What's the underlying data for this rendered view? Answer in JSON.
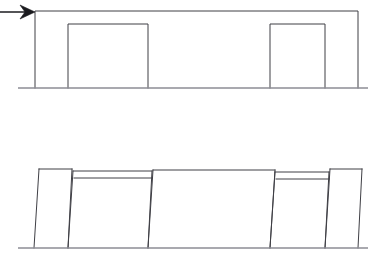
{
  "figure": {
    "background_color": "#ffffff",
    "line_color": "#3f3f45",
    "ground_color": "#8d8d94",
    "arrow_color": "#1b1b1f",
    "width": 380,
    "height": 258,
    "panels": [
      {
        "id": "undeformed-frame",
        "label": "undeformed frame elevation",
        "ground_line": {
          "x1": 18,
          "y1": 88,
          "x2": 368,
          "y2": 88
        },
        "outer_outline": "M 35,88 L 35,11 L 358,11 L 358,88",
        "openings": [
          {
            "id": "opening-left",
            "x": 68,
            "y": 24,
            "width": 80,
            "height": 64,
            "outline": "M 68,88 L 68,24 L 148,24 L 148,88"
          },
          {
            "id": "opening-right",
            "x": 270,
            "y": 24,
            "width": 55,
            "height": 64,
            "outline": "M 270,88 L 270,24 L 325,24 L 325,88"
          }
        ]
      },
      {
        "id": "deformed-frame",
        "label": "deformed frame elevation with lateral sway",
        "ground_line": {
          "x1": 18,
          "y1": 248,
          "x2": 368,
          "y2": 248
        },
        "members": [
          {
            "id": "pier-1-left",
            "outline": "M 34,248 L 39,169"
          },
          {
            "id": "pier-1-right",
            "outline": "M 68,248 L 72,169"
          },
          {
            "id": "pier-1-top",
            "outline": "M 39,169 L 72,169"
          },
          {
            "id": "pier-2-left",
            "outline": "M 68,248 L 73,171"
          },
          {
            "id": "pier-2-right",
            "outline": "M 148,248 L 152,171"
          },
          {
            "id": "pier-2-top",
            "outline": "M 73,171 L 152,171"
          },
          {
            "id": "pier-2-soffit",
            "outline": "M 74,178 L 152,178"
          },
          {
            "id": "bay-mid-left",
            "outline": "M 148,248 L 153,170"
          },
          {
            "id": "bay-mid-right",
            "outline": "M 270,248 L 275,170"
          },
          {
            "id": "bay-mid-top",
            "outline": "M 153,170 L 275,170"
          },
          {
            "id": "pier-3-left",
            "outline": "M 270,248 L 275,172"
          },
          {
            "id": "pier-3-right",
            "outline": "M 325,248 L 329,172"
          },
          {
            "id": "pier-3-top",
            "outline": "M 275,172 L 329,172"
          },
          {
            "id": "pier-3-soffit",
            "outline": "M 276,179 L 329,179"
          },
          {
            "id": "pier-4-left",
            "outline": "M 325,248 L 330,169"
          },
          {
            "id": "pier-4-right",
            "outline": "M 358,248 L 362,169"
          },
          {
            "id": "pier-4-top",
            "outline": "M 330,169 L 362,169"
          }
        ]
      }
    ],
    "annotations": [
      {
        "id": "lateral-load-arrow",
        "label": "lateral load arrow",
        "shaft": {
          "x1": 0,
          "y1": 12,
          "x2": 27,
          "y2": 12
        },
        "head_points": "20,5 35,12 20,19 25,12",
        "points_to": "top-left corner of undeformed frame"
      }
    ]
  }
}
